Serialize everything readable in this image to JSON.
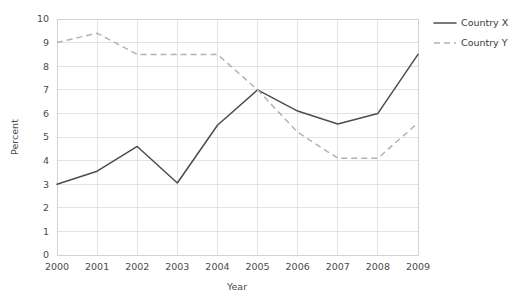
{
  "chart_data": {
    "type": "line",
    "title": "",
    "subtitle": "",
    "xlabel": "Year",
    "ylabel": "Percent",
    "categories": [
      "2000",
      "2001",
      "2002",
      "2003",
      "2004",
      "2005",
      "2006",
      "2007",
      "2008",
      "2009"
    ],
    "x": [
      2000,
      2001,
      2002,
      2003,
      2004,
      2005,
      2006,
      2007,
      2008,
      2009
    ],
    "series": [
      {
        "name": "Country X",
        "style": "solid",
        "color": "#4d4d4d",
        "values": [
          3.0,
          3.55,
          4.6,
          3.05,
          5.5,
          7.0,
          6.1,
          5.55,
          6.0,
          8.5
        ]
      },
      {
        "name": "Country Y",
        "style": "dashed",
        "color": "#b2b2b2",
        "values": [
          9.0,
          9.4,
          8.5,
          8.5,
          8.5,
          7.0,
          5.2,
          4.1,
          4.1,
          5.6
        ]
      }
    ],
    "ylim": [
      0,
      10
    ],
    "yticks": [
      0,
      1,
      2,
      3,
      4,
      5,
      6,
      7,
      8,
      9,
      10
    ],
    "ytick_labels": [
      "0",
      "1",
      "2",
      "3",
      "4",
      "5",
      "6",
      "7",
      "8",
      "9",
      "10"
    ],
    "xtick_labels": [
      "2000",
      "2001",
      "2002",
      "2003",
      "2004",
      "2005",
      "2006",
      "2007",
      "2008",
      "2009"
    ],
    "grid": true,
    "grid_axes": "both",
    "legend_position": "top-right-outside",
    "legend_entries": [
      "Country X",
      "Country Y"
    ],
    "background_color": "#ffffff",
    "grid_color": "#dcdcdc",
    "axis_color": "#cfcfcf",
    "text_color": "#4a4a4a"
  }
}
